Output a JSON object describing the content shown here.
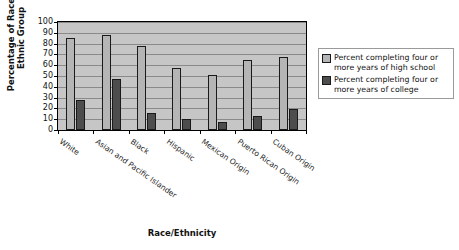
{
  "chart_data": {
    "type": "bar",
    "title": "",
    "xlabel": "Race/Ethnicity",
    "ylabel": "Percentage of Race or Ethnic Group",
    "ylabel_line1": "Percentage of Race or",
    "ylabel_line2": "Ethnic Group",
    "ylim": [
      0,
      100
    ],
    "yticks": [
      0,
      10,
      20,
      30,
      40,
      50,
      60,
      70,
      80,
      90,
      100
    ],
    "grid": true,
    "legend_position": "right",
    "categories": [
      "White",
      "Asian and Pacific Islander",
      "Black",
      "Hispanic",
      "Mexican Origin",
      "Puerto Rican Origin",
      "Cuban Origin"
    ],
    "series": [
      {
        "name": "Percent completing four or more years of high school",
        "name_line1": "Percent completing four or",
        "name_line2": "more years of high school",
        "color": "#b5b5b5",
        "values": [
          85,
          88,
          78,
          57,
          51,
          65,
          68
        ]
      },
      {
        "name": "Percent completing four or more years of college",
        "name_line1": "Percent completing four or",
        "name_line2": "more years of college",
        "color": "#4d4d4d",
        "values": [
          28,
          47,
          16,
          10,
          7,
          13,
          19
        ]
      }
    ],
    "plot_background": "#c6c6c6",
    "gridline_color": "#8a8a8a",
    "axis_color": "#000000"
  }
}
